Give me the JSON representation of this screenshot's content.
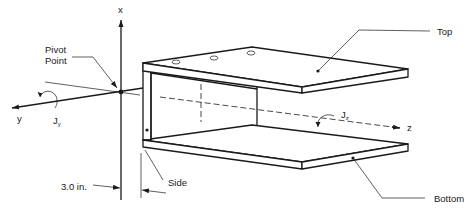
{
  "diagram": {
    "axes": {
      "x_label": "x",
      "y_label": "y",
      "z_label": "z",
      "moment_y_label": "J",
      "moment_y_sub": "y",
      "moment_z_label": "J",
      "moment_z_sub": "z"
    },
    "labels": {
      "pivot_line1": "Pivot",
      "pivot_line2": "Point",
      "top": "Top",
      "bottom": "Bottom",
      "side": "Side",
      "dimension": "3.0 in."
    },
    "colors": {
      "ink": "#1a1a1a",
      "background": "#ffffff"
    }
  }
}
